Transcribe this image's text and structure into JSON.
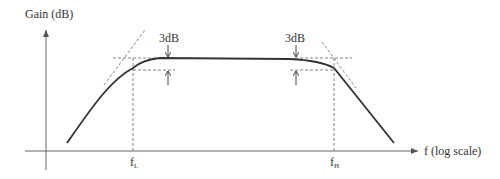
{
  "diagram": {
    "y_axis_label": "Gain (dB)",
    "x_axis_label": "f (log scale)",
    "left_cutoff": {
      "label": "f",
      "subscript": "L"
    },
    "right_cutoff": {
      "label": "f",
      "subscript": "H"
    },
    "left_annotation": "3dB",
    "right_annotation": "3dB",
    "colors": {
      "curve": "#333333",
      "axes": "#555555",
      "dashed": "#666666"
    }
  }
}
